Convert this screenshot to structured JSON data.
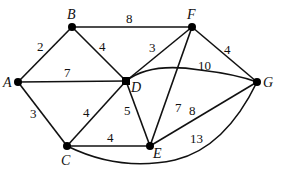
{
  "graph": {
    "nodes": [
      {
        "id": "A",
        "label": "A",
        "x": 18,
        "y": 82
      },
      {
        "id": "B",
        "label": "B",
        "x": 72,
        "y": 27
      },
      {
        "id": "C",
        "label": "C",
        "x": 67,
        "y": 146
      },
      {
        "id": "D",
        "label": "D",
        "x": 126,
        "y": 81
      },
      {
        "id": "E",
        "label": "E",
        "x": 150,
        "y": 146
      },
      {
        "id": "F",
        "label": "F",
        "x": 192,
        "y": 27
      },
      {
        "id": "G",
        "label": "G",
        "x": 257,
        "y": 82
      }
    ],
    "edges": [
      {
        "from": "A",
        "to": "B",
        "weight": "2"
      },
      {
        "from": "A",
        "to": "D",
        "weight": "7"
      },
      {
        "from": "A",
        "to": "C",
        "weight": "3"
      },
      {
        "from": "B",
        "to": "F",
        "weight": "8"
      },
      {
        "from": "B",
        "to": "D",
        "weight": "4"
      },
      {
        "from": "C",
        "to": "D",
        "weight": "4"
      },
      {
        "from": "C",
        "to": "E",
        "weight": "4"
      },
      {
        "from": "C",
        "to": "G",
        "weight": "13"
      },
      {
        "from": "D",
        "to": "F",
        "weight": "3"
      },
      {
        "from": "D",
        "to": "E",
        "weight": "5"
      },
      {
        "from": "D",
        "to": "G",
        "weight": "10"
      },
      {
        "from": "E",
        "to": "F",
        "weight": "7"
      },
      {
        "from": "E",
        "to": "G",
        "weight": "8"
      },
      {
        "from": "F",
        "to": "G",
        "weight": "4"
      }
    ]
  }
}
